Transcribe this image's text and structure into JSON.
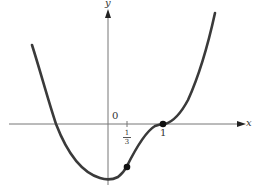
{
  "axes": {
    "x_label": "x",
    "y_label": "y",
    "origin_label": "0",
    "tick_labels": [
      {
        "numerator": "1",
        "denominator": "3"
      },
      {
        "value": "1"
      }
    ]
  },
  "curve": {
    "description": "Polynomial curve with a minimum near x=0 and inflection points at x=1/3 and x=1 (horizontal tangent at x=1)",
    "color": "#3a3a3a"
  },
  "points": [
    {
      "label": "inflection point at x=1/3"
    },
    {
      "label": "inflection point at x=1"
    }
  ]
}
